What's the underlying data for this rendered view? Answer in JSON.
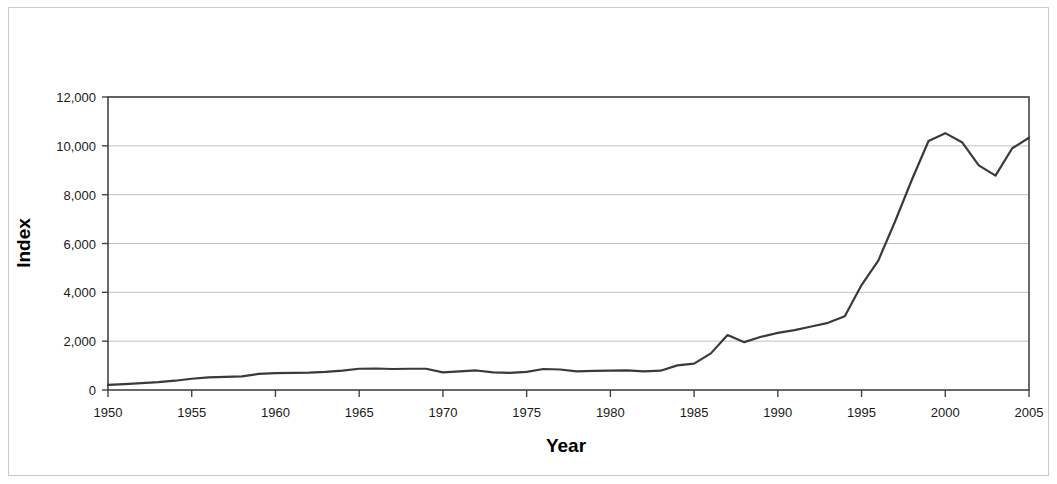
{
  "chart_data": {
    "type": "line",
    "title": "",
    "xlabel": "Year",
    "ylabel": "Index",
    "xlim": [
      1950,
      2005
    ],
    "ylim": [
      0,
      12000
    ],
    "grid": true,
    "legend": null,
    "xticks": [
      "1950",
      "1955",
      "1960",
      "1965",
      "1970",
      "1975",
      "1980",
      "1985",
      "1990",
      "1995",
      "2000",
      "2005"
    ],
    "yticks": [
      "0",
      "2,000",
      "4,000",
      "6,000",
      "8,000",
      "10,000",
      "12,000"
    ],
    "xtick_values": [
      1950,
      1955,
      1960,
      1965,
      1970,
      1975,
      1980,
      1985,
      1990,
      1995,
      2000,
      2005
    ],
    "ytick_values": [
      0,
      2000,
      4000,
      6000,
      8000,
      10000,
      12000
    ],
    "series": [
      {
        "name": "Index",
        "color": "#3a3a3a",
        "x": [
          1950,
          1951,
          1952,
          1953,
          1954,
          1955,
          1956,
          1957,
          1958,
          1959,
          1960,
          1961,
          1962,
          1963,
          1964,
          1965,
          1966,
          1967,
          1968,
          1969,
          1970,
          1971,
          1972,
          1973,
          1974,
          1975,
          1976,
          1977,
          1978,
          1979,
          1980,
          1981,
          1982,
          1983,
          1984,
          1985,
          1986,
          1987,
          1988,
          1989,
          1990,
          1991,
          1992,
          1993,
          1994,
          1995,
          1996,
          1997,
          1998,
          1999,
          2000,
          2001,
          2002,
          2003,
          2004,
          2005
        ],
        "values": [
          210,
          240,
          280,
          320,
          380,
          460,
          520,
          540,
          560,
          660,
          690,
          700,
          710,
          740,
          790,
          870,
          880,
          860,
          870,
          870,
          720,
          760,
          800,
          720,
          700,
          740,
          860,
          840,
          760,
          780,
          790,
          800,
          760,
          790,
          1010,
          1080,
          1500,
          2250,
          1960,
          2180,
          2340,
          2450,
          2600,
          2750,
          3020,
          4300,
          5300,
          6900,
          8600,
          10200,
          10520,
          10150,
          9200,
          8780,
          9900,
          10330
        ]
      }
    ]
  },
  "axis": {
    "x_title": "Year",
    "y_title": "Index"
  }
}
